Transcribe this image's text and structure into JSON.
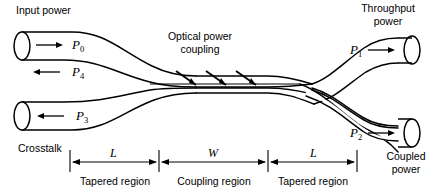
{
  "figure": {
    "width": 446,
    "height": 196,
    "background": "#ffffff",
    "line_color": "#000000"
  },
  "annotations": {
    "input_power": "Input power",
    "throughput_power_line1": "Throughput",
    "throughput_power_line2": "power",
    "optical_coupling_line1": "Optical power",
    "optical_coupling_line2": "coupling",
    "crosstalk": "Crosstalk",
    "coupled_power_line1": "Coupled",
    "coupled_power_line2": "power"
  },
  "port_symbols": {
    "p0": {
      "base": "P",
      "sub": "0",
      "arrow": "right",
      "description": "input power into port 0"
    },
    "p4": {
      "base": "P",
      "sub": "4",
      "arrow": "left",
      "description": "back-reflected power out of port 4"
    },
    "p3": {
      "base": "P",
      "sub": "3",
      "arrow": "left",
      "description": "crosstalk power out of port 3"
    },
    "p1": {
      "base": "P",
      "sub": "1",
      "arrow": "right",
      "description": "throughput power out of port 1"
    },
    "p2": {
      "base": "P",
      "sub": "2",
      "arrow": "right",
      "description": "coupled power out of port 2"
    }
  },
  "dimensions": [
    {
      "symbol": "L",
      "label": "Tapered region"
    },
    {
      "symbol": "W",
      "label": "Coupling region"
    },
    {
      "symbol": "L",
      "label": "Tapered region"
    }
  ],
  "coupling_arrows": {
    "count": 3,
    "direction": "down-right",
    "note": "power transfer between the two fused waveguides"
  }
}
